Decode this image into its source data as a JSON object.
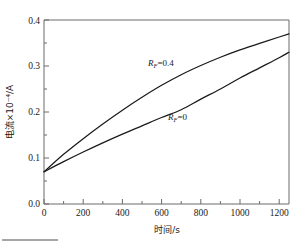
{
  "figure": {
    "background_color": "#ffffff",
    "axis_color": "#6a6a6a",
    "curve_color": "#1a1a1a"
  },
  "axes": {
    "x_title": "时间/s",
    "y_title": "电流×10⁻⁴/A",
    "x_ticks": [
      "0",
      "200",
      "400",
      "600",
      "800",
      "1000",
      "1200"
    ],
    "y_ticks": [
      "0.0",
      "0.1",
      "0.2",
      "0.3",
      "0.4"
    ]
  },
  "annotations": {
    "upper_label_prefix": "R",
    "upper_label_sub": "F",
    "upper_label_value": "=0.4",
    "lower_label_prefix": "R",
    "lower_label_sub": "F",
    "lower_label_value": "=0"
  },
  "chart_data": {
    "type": "line",
    "title": "",
    "xlabel": "时间/s",
    "ylabel": "电流×10⁻⁴/A",
    "xlim": [
      0,
      1250
    ],
    "ylim": [
      0.0,
      0.4
    ],
    "xticks": [
      0,
      200,
      400,
      600,
      800,
      1000,
      1200
    ],
    "yticks": [
      0.0,
      0.1,
      0.2,
      0.3,
      0.4
    ],
    "grid": false,
    "legend": "inline-annotations",
    "series": [
      {
        "name": "R_F=0.4",
        "label": "RF=0.4",
        "x": [
          0,
          100,
          200,
          300,
          400,
          500,
          600,
          700,
          800,
          900,
          1000,
          1100,
          1200,
          1250
        ],
        "values": [
          0.07,
          0.108,
          0.142,
          0.174,
          0.204,
          0.232,
          0.258,
          0.281,
          0.301,
          0.319,
          0.335,
          0.349,
          0.363,
          0.37
        ]
      },
      {
        "name": "R_F=0",
        "label": "RF=0",
        "x": [
          0,
          100,
          200,
          300,
          400,
          500,
          600,
          700,
          800,
          900,
          1000,
          1100,
          1200,
          1250
        ],
        "values": [
          0.07,
          0.092,
          0.113,
          0.133,
          0.152,
          0.17,
          0.188,
          0.205,
          0.228,
          0.25,
          0.274,
          0.296,
          0.318,
          0.33
        ]
      }
    ]
  }
}
